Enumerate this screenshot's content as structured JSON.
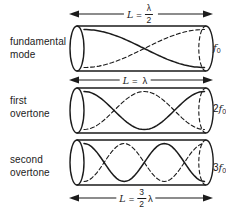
{
  "figure": {
    "colors": {
      "ink": "#1b1b1b",
      "background": "#ffffff"
    },
    "rows": [
      {
        "mode_line1": "fundamental",
        "mode_line2": "mode",
        "harmonic": 1,
        "length": {
          "pre": "L",
          "eq": "=",
          "frac_num": "λ",
          "frac_den": "2",
          "post": ""
        },
        "frequency": {
          "mult": "",
          "symbol": "f",
          "sub": "0"
        }
      },
      {
        "mode_line1": "first",
        "mode_line2": "overtone",
        "harmonic": 2,
        "length": {
          "pre": "L",
          "eq": "=",
          "frac_num": "",
          "frac_den": "",
          "post": "λ"
        },
        "frequency": {
          "mult": "2",
          "symbol": "f",
          "sub": "0"
        }
      },
      {
        "mode_line1": "second",
        "mode_line2": "overtone",
        "harmonic": 3,
        "length": {
          "pre": "L",
          "eq": "=",
          "frac_num": "3",
          "frac_den": "2",
          "post": "λ"
        },
        "frequency": {
          "mult": "3",
          "symbol": "f",
          "sub": "0"
        }
      }
    ]
  }
}
